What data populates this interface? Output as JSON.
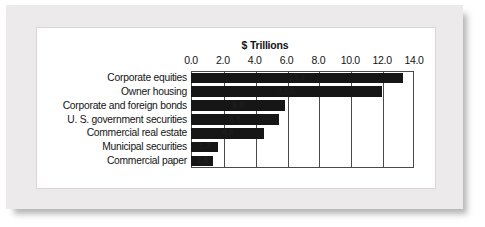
{
  "chart_data": {
    "type": "bar",
    "orientation": "horizontal",
    "title": "$ Trillions",
    "xlabel": "",
    "ylabel": "",
    "xlim": [
      0.0,
      14.0
    ],
    "xticks": [
      "0.0",
      "2.0",
      "4.0",
      "6.0",
      "8.0",
      "10.0",
      "12.0",
      "14.0"
    ],
    "xtick_values": [
      0,
      2,
      4,
      6,
      8,
      10,
      12,
      14
    ],
    "grid": "vertical",
    "legend": "none",
    "bar_color": "#161616",
    "categories": [
      "Corporate equities",
      "Owner housing",
      "Corporate and foreign bonds",
      "U. S. government securities",
      "Commercial real estate",
      "Municipal securities",
      "Commercial paper"
    ],
    "values": [
      13.3,
      12.0,
      5.9,
      5.5,
      4.6,
      1.7,
      1.4
    ],
    "value_labels": [
      "13.3",
      "12.0",
      "5.9",
      "5.5",
      "4.6",
      "1.7",
      "1.4"
    ]
  }
}
